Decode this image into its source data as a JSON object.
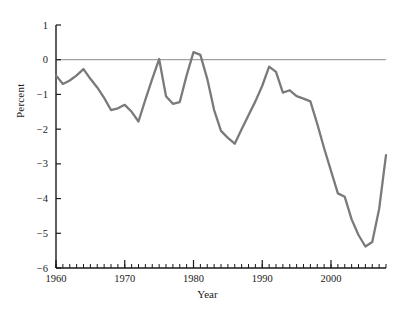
{
  "chart_data": {
    "type": "line",
    "title": "",
    "subtitle": "",
    "xlabel": "Year",
    "ylabel": "Percent",
    "xlim": [
      1960,
      2008
    ],
    "ylim": [
      -6,
      1
    ],
    "grid": false,
    "legend": null,
    "zero_reference_line": 0,
    "line_color": "#7a7a7a",
    "axis_color": "#1a1a1a",
    "xticks_major": [
      1960,
      1970,
      1980,
      1990,
      2000
    ],
    "xtick_labels": [
      "1960",
      "1970",
      "1980",
      "1990",
      "2000"
    ],
    "xticks_minor_step": 1,
    "yticks": [
      1,
      0,
      -1,
      -2,
      -3,
      -4,
      -5,
      -6
    ],
    "ytick_labels": [
      "1",
      "0",
      "−1",
      "−2",
      "−3",
      "−4",
      "−5",
      "−6"
    ],
    "series": [
      {
        "name": "Percent",
        "x": [
          1960,
          1961,
          1962,
          1963,
          1964,
          1965,
          1966,
          1967,
          1968,
          1969,
          1970,
          1971,
          1972,
          1973,
          1974,
          1975,
          1976,
          1977,
          1978,
          1979,
          1980,
          1981,
          1982,
          1983,
          1984,
          1985,
          1986,
          1987,
          1988,
          1989,
          1990,
          1991,
          1992,
          1993,
          1994,
          1995,
          1996,
          1997,
          1998,
          1999,
          2000,
          2001,
          2002,
          2003,
          2004,
          2005,
          2006,
          2007,
          2008
        ],
        "values": [
          -0.45,
          -0.7,
          -0.6,
          -0.45,
          -0.27,
          -0.55,
          -0.8,
          -1.1,
          -1.45,
          -1.4,
          -1.3,
          -1.5,
          -1.78,
          -1.15,
          -0.55,
          0.02,
          -1.05,
          -1.27,
          -1.22,
          -0.45,
          0.22,
          0.14,
          -0.55,
          -1.45,
          -2.05,
          -2.25,
          -2.42,
          -2.0,
          -1.6,
          -1.2,
          -0.75,
          -0.2,
          -0.35,
          -0.95,
          -0.88,
          -1.05,
          -1.12,
          -1.2,
          -1.85,
          -2.55,
          -3.2,
          -3.85,
          -3.95,
          -4.6,
          -5.05,
          -5.38,
          -5.25,
          -4.3,
          -2.75
        ]
      }
    ]
  },
  "axis": {
    "x_label": "Year",
    "y_label": "Percent"
  }
}
